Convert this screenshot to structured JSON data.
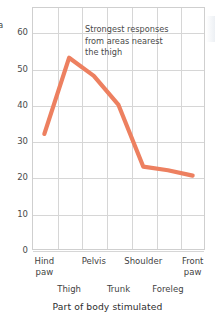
{
  "chart_data": {
    "type": "line",
    "title": "",
    "xlabel": "Part of body stimulated",
    "ylabel": "a",
    "categories": [
      "Hind\npaw",
      "Thigh",
      "Pelvis",
      "Trunk",
      "Shoulder",
      "Foreleg",
      "Front\npaw"
    ],
    "categories_flat": [
      "Hind paw",
      "Thigh",
      "Pelvis",
      "Trunk",
      "Shoulder",
      "Foreleg",
      "Front paw"
    ],
    "values": [
      32,
      53,
      48,
      40,
      23,
      22,
      20.5
    ],
    "ylim": [
      0,
      67
    ],
    "xlim": [
      0,
      7
    ],
    "yticks": [
      0,
      10,
      20,
      30,
      40,
      50,
      60
    ],
    "ytick_labels": [
      "0",
      "10",
      "20",
      "30",
      "40",
      "50",
      "60"
    ],
    "grid": true,
    "legend": "none",
    "series_color": "#ED8060",
    "grid_color": "#d6d6d6",
    "frame_color": "#cfcfcf",
    "annotations": [
      {
        "text": "Strongest responses\nfrom areas nearest\nthe thigh",
        "lines": [
          "Strongest responses",
          "from areas nearest",
          "the thigh"
        ]
      }
    ]
  },
  "axis": {
    "y_title_partial": "a",
    "x_title": "Part of body stimulated"
  },
  "x_rows": {
    "top": [
      {
        "label": "Hind\npaw",
        "index": 0
      },
      {
        "label": "Pelvis",
        "index": 2
      },
      {
        "label": "Shoulder",
        "index": 4
      },
      {
        "label": "Front\npaw",
        "index": 6
      }
    ],
    "bottom": [
      {
        "label": "Thigh",
        "index": 1
      },
      {
        "label": "Trunk",
        "index": 3
      },
      {
        "label": "Foreleg",
        "index": 5
      }
    ]
  }
}
